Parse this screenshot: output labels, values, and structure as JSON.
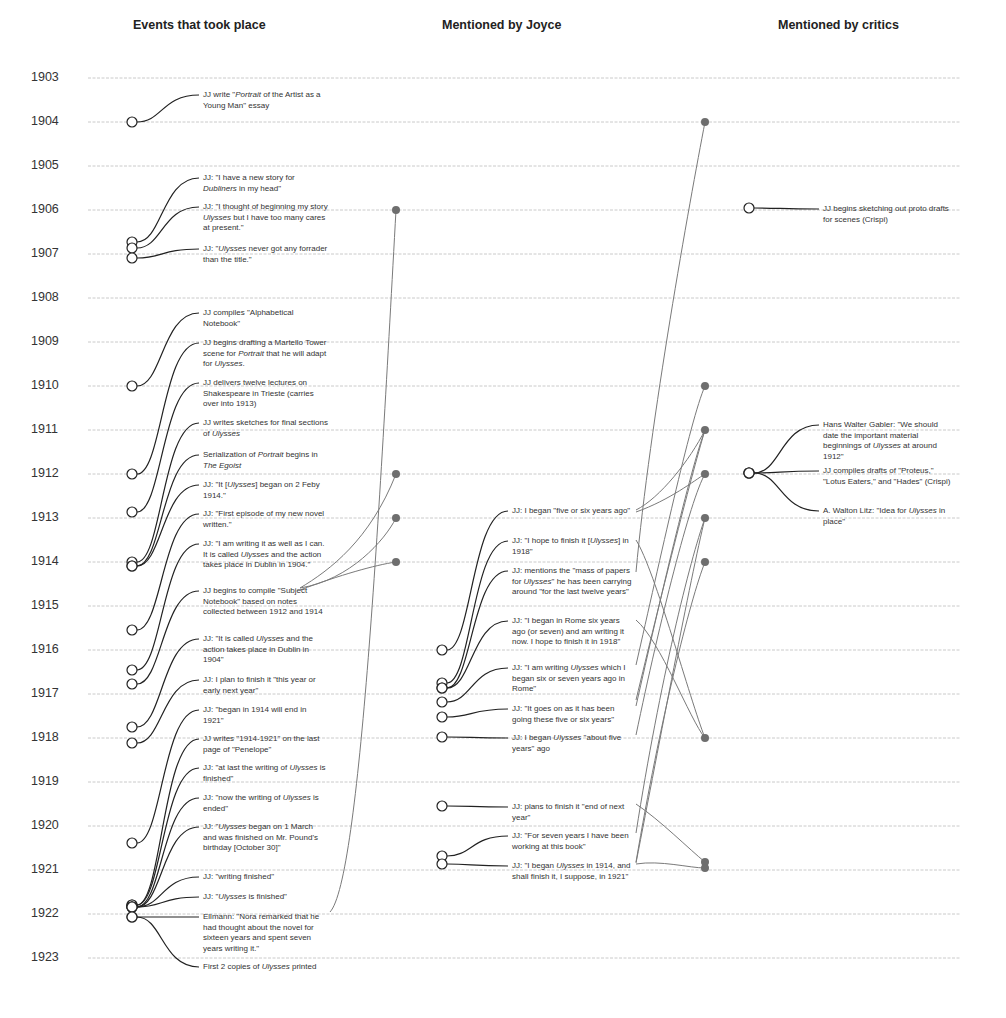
{
  "columns": [
    {
      "title": "Events that took place",
      "x": 133
    },
    {
      "title": "Mentioned by Joyce",
      "x": 442
    },
    {
      "title": "Mentioned by critics",
      "x": 778
    }
  ],
  "colors": {
    "gridline": "#bdbdbd",
    "event_line": "#222222",
    "connector_line": "#7a7a7a",
    "anchor_dot": "#6e6e6e",
    "text": "#333333"
  },
  "years": [
    "1903",
    "1904",
    "1905",
    "1906",
    "1907",
    "1908",
    "1909",
    "1910",
    "1911",
    "1912",
    "1913",
    "1914",
    "1915",
    "1916",
    "1917",
    "1918",
    "1919",
    "1920",
    "1921",
    "1922",
    "1923"
  ],
  "year_y": [
    78,
    122,
    166,
    210,
    254,
    298,
    342,
    386,
    430,
    474,
    518,
    562,
    606,
    650,
    694,
    738,
    782,
    826,
    870,
    914,
    958
  ],
  "events": [
    {
      "text": "JJ write \"Portrait of the Artist as a Young Man\" essay",
      "circle": [
        132,
        122
      ],
      "label": [
        203,
        92
      ]
    },
    {
      "text": "JJ: \"I have a new story for Dubliners in my head\"",
      "circle": [
        132,
        242
      ],
      "label": [
        203,
        175
      ]
    },
    {
      "text": "JJ: \"I thought of beginning my story Ulysses but I have too many cares at present.\"",
      "circle": [
        132,
        248
      ],
      "label": [
        203,
        204
      ]
    },
    {
      "text": "JJ: \"Ulysses never got any forrader than the title.\"",
      "circle": [
        132,
        258
      ],
      "label": [
        203,
        246
      ]
    },
    {
      "text": "JJ compiles \"Alphabetical Notebook\"",
      "circle": [
        132,
        386
      ],
      "label": [
        203,
        310
      ]
    },
    {
      "text": "JJ begins drafting a Martello Tower scene for Portrait that he will adapt for Ulysses.",
      "circle": [
        132,
        474
      ],
      "label": [
        203,
        340
      ]
    },
    {
      "text": "JJ delivers twelve lectures on Shakespeare in Trieste (carries over into 1913)",
      "circle": [
        132,
        512
      ],
      "label": [
        203,
        380
      ]
    },
    {
      "text": "JJ writes sketches for final sections of Ulysses",
      "circle": [
        132,
        562
      ],
      "label": [
        203,
        420
      ]
    },
    {
      "text": "Serialization of Portrait begins in The Egoist",
      "circle": [
        132,
        566
      ],
      "label": [
        203,
        452
      ]
    },
    {
      "text": "JJ: \"It [Ulysses] began on 2 Feby 1914.\"",
      "circle": [
        132,
        566
      ],
      "label": [
        203,
        482
      ]
    },
    {
      "text": "JJ: \"First episode of my new novel written.\"",
      "circle": [
        132,
        630
      ],
      "label": [
        203,
        511
      ]
    },
    {
      "text": "JJ: \"I am writing it as well as I can. It is called Ulysses and the action takes place in Dublin in 1904.\"",
      "circle": [
        132,
        670
      ],
      "label": [
        203,
        541
      ]
    },
    {
      "text": "JJ begins to compile \"Subject Notebook\" based on notes collected between 1912 and 1914",
      "circle": [
        132,
        684
      ],
      "label": [
        203,
        588
      ]
    },
    {
      "text": "JJ: \"It is called Ulysses and the action takes place in Dublin in 1904\"",
      "circle": [
        132,
        727
      ],
      "label": [
        203,
        636
      ]
    },
    {
      "text": "JJ: I plan to finish it \"this year or early next year\"",
      "circle": [
        132,
        743
      ],
      "label": [
        203,
        677
      ]
    },
    {
      "text": "JJ: \"began in 1914 will end in 1921\"",
      "circle": [
        132,
        843
      ],
      "label": [
        203,
        707
      ]
    },
    {
      "text": "JJ writes \"1914-1921\" on the last page of \"Penelope\"",
      "circle": [
        132,
        905
      ],
      "label": [
        203,
        736
      ]
    },
    {
      "text": "JJ: \"at last the writing of Ulysses is finished\"",
      "circle": [
        132,
        905
      ],
      "label": [
        203,
        765
      ]
    },
    {
      "text": "JJ: \"now the writing of Ulysses is ended\"",
      "circle": [
        132,
        907
      ],
      "label": [
        203,
        795
      ]
    },
    {
      "text": "JJ: \"Ulysses began on 1 March and was finished on Mr. Pound's birthday [October 30]\"",
      "circle": [
        132,
        907
      ],
      "label": [
        203,
        824
      ]
    },
    {
      "text": "JJ: \"writing finished\"",
      "circle": [
        132,
        907
      ],
      "label": [
        203,
        874
      ]
    },
    {
      "text": "JJ: \"Ulysses is finished\"",
      "circle": [
        132,
        907
      ],
      "label": [
        203,
        894
      ]
    },
    {
      "text": "Ellmann: \"Nora remarked that he had thought about the novel for sixteen years and spent seven years writing it.\"",
      "circle": [
        132,
        917
      ],
      "label": [
        203,
        914
      ]
    },
    {
      "text": "First 2 copies of Ulysses printed",
      "circle": [
        132,
        917
      ],
      "label": [
        203,
        964
      ]
    }
  ],
  "joyce": [
    {
      "text": "JJ: I began \"five or six years ago\"",
      "circle": [
        442,
        650
      ],
      "label": [
        512,
        508
      ]
    },
    {
      "text": "JJ: \"I hope to finish it [Ulysses] in 1918\"",
      "circle": [
        442,
        683
      ],
      "label": [
        512,
        538
      ]
    },
    {
      "text": "JJ: mentions the \"mass of papers for Ulysses\" he has been carrying around \"for the last twelve years\"",
      "circle": [
        442,
        688
      ],
      "label": [
        512,
        568
      ]
    },
    {
      "text": "JJ: \"I began in Rome six years ago (or seven) and am writing it now. I hope to finish it in 1918\"",
      "circle": [
        442,
        688
      ],
      "label": [
        512,
        618
      ]
    },
    {
      "text": "JJ: \"I am writing Ulysses which I began six or seven years ago in Rome\"",
      "circle": [
        442,
        702
      ],
      "label": [
        512,
        665
      ]
    },
    {
      "text": "JJ: \"It goes on as it has been going these five or six years\"",
      "circle": [
        442,
        717
      ],
      "label": [
        512,
        706
      ]
    },
    {
      "text": "JJ: I began Ulysses \"about five years\" ago",
      "circle": [
        442,
        737
      ],
      "label": [
        512,
        735
      ]
    },
    {
      "text": "JJ: plans to finish it \"end of next year\"",
      "circle": [
        442,
        806
      ],
      "label": [
        512,
        804
      ]
    },
    {
      "text": "JJ: \"For seven years I have been working at this book\"",
      "circle": [
        442,
        856
      ],
      "label": [
        512,
        833
      ]
    },
    {
      "text": "JJ: \"I began Ulysses in 1914, and shall finish it, I suppose, in 1921\"",
      "circle": [
        442,
        864
      ],
      "label": [
        512,
        863
      ]
    }
  ],
  "critics": [
    {
      "text": "JJ begins sketching out proto drafts for scenes (Crispi)",
      "circle": [
        749,
        208
      ],
      "label": [
        823,
        206
      ]
    },
    {
      "text": "Hans Walter Gabler: \"We should date the important material beginnings of Ulysses at around 1912\"",
      "circle": [
        749,
        473
      ],
      "label": [
        823,
        422
      ]
    },
    {
      "text": "JJ compiles drafts of \"Proteus,\" \"Lotus Eaters,\" and \"Hades\" (Crispi)",
      "circle": [
        749,
        473
      ],
      "label": [
        823,
        468
      ]
    },
    {
      "text": "A. Walton Litz: \"Idea for Ulysses in place\"",
      "circle": [
        749,
        473
      ],
      "label": [
        823,
        508
      ]
    }
  ],
  "anchors": {
    "joyce_col": [
      [
        396,
        210
      ],
      [
        396,
        474
      ],
      [
        396,
        518
      ],
      [
        396,
        562
      ]
    ],
    "critic_col": [
      [
        705,
        122
      ],
      [
        705,
        386
      ],
      [
        705,
        430
      ],
      [
        705,
        474
      ],
      [
        705,
        518
      ],
      [
        705,
        562
      ],
      [
        705,
        738
      ],
      [
        705,
        862
      ],
      [
        705,
        868
      ]
    ]
  }
}
